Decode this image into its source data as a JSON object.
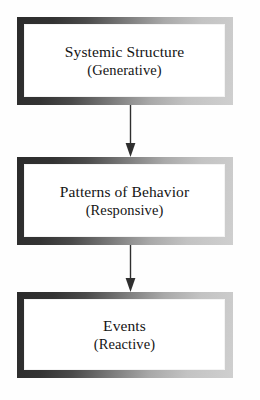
{
  "diagram": {
    "type": "vertical-flow",
    "orientation": "top-to-bottom",
    "colors": {
      "page_background": "#fefefe",
      "box_fill": "#ffffff",
      "frame_dark": "#2b2b2b",
      "frame_light": "#cfcfcf",
      "text": "#141414",
      "arrow": "#2f2f2f"
    },
    "nodes": [
      {
        "id": "systemic-structure",
        "primary": "Systemic Structure",
        "secondary": "(Generative)"
      },
      {
        "id": "patterns-of-behavior",
        "primary": "Patterns of Behavior",
        "secondary": "(Responsive)"
      },
      {
        "id": "events",
        "primary": "Events",
        "secondary": "(Reactive)"
      }
    ],
    "connectors": [
      {
        "id": "connector-structure-to-patterns",
        "icon": "down-arrow-icon",
        "from": "systemic-structure",
        "to": "patterns-of-behavior"
      },
      {
        "id": "connector-patterns-to-events",
        "icon": "down-arrow-icon",
        "from": "patterns-of-behavior",
        "to": "events"
      }
    ]
  }
}
